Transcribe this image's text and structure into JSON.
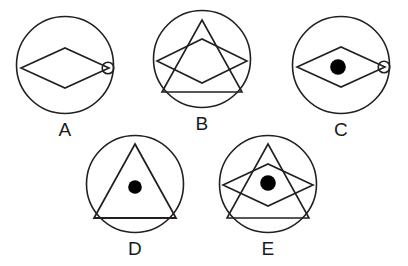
{
  "figure": {
    "background_color": "#ffffff",
    "stroke_color": "#231f20",
    "fill_color": "#000000",
    "layout": {
      "rows": 2,
      "row1_count": 3,
      "row2_count": 2,
      "circle_diameter_px": 102
    }
  },
  "options": [
    {
      "id": "A",
      "label": "A",
      "position": {
        "x": 14,
        "y": 14
      },
      "circle": {
        "cx": 51,
        "cy": 51,
        "r": 49
      },
      "elements": [
        "outer-circle",
        "rhombus",
        "small-circle-at-right-vertex"
      ],
      "rhombus": {
        "cx": 51,
        "cy": 54,
        "half_width": 44,
        "half_height": 20
      },
      "small_circle": {
        "cx": 94,
        "cy": 54,
        "r": 6,
        "filled": false
      },
      "center_dot": null,
      "triangle": null
    },
    {
      "id": "B",
      "label": "B",
      "position": {
        "x": 151,
        "y": 8
      },
      "circle": {
        "cx": 51,
        "cy": 51,
        "r": 49
      },
      "elements": [
        "outer-circle",
        "triangle",
        "rhombus"
      ],
      "rhombus": {
        "cx": 51,
        "cy": 53,
        "half_width": 45,
        "half_height": 22
      },
      "small_circle": null,
      "center_dot": null,
      "triangle": {
        "apex_x": 51,
        "apex_y": 12,
        "base_y": 84,
        "half_base": 40
      }
    },
    {
      "id": "C",
      "label": "C",
      "position": {
        "x": 290,
        "y": 14
      },
      "circle": {
        "cx": 51,
        "cy": 51,
        "r": 49
      },
      "elements": [
        "outer-circle",
        "rhombus",
        "center-dot",
        "small-circle-at-right-vertex"
      ],
      "rhombus": {
        "cx": 51,
        "cy": 53,
        "half_width": 44,
        "half_height": 20
      },
      "small_circle": {
        "cx": 94,
        "cy": 53,
        "r": 6,
        "filled": false
      },
      "center_dot": {
        "cx": 48,
        "cy": 53,
        "r": 8
      },
      "triangle": null
    },
    {
      "id": "D",
      "label": "D",
      "position": {
        "x": 84,
        "y": 133
      },
      "circle": {
        "cx": 51,
        "cy": 51,
        "r": 49
      },
      "elements": [
        "outer-circle",
        "triangle",
        "center-dot"
      ],
      "rhombus": null,
      "small_circle": null,
      "center_dot": {
        "cx": 51,
        "cy": 54,
        "r": 7
      },
      "triangle": {
        "apex_x": 51,
        "apex_y": 11,
        "base_y": 85,
        "half_base": 41
      }
    },
    {
      "id": "E",
      "label": "E",
      "position": {
        "x": 217,
        "y": 133
      },
      "circle": {
        "cx": 51,
        "cy": 51,
        "r": 49
      },
      "elements": [
        "outer-circle",
        "triangle",
        "rhombus",
        "center-dot"
      ],
      "rhombus": {
        "cx": 51,
        "cy": 52,
        "half_width": 45,
        "half_height": 21
      },
      "small_circle": null,
      "center_dot": {
        "cx": 51,
        "cy": 50,
        "r": 8
      },
      "triangle": {
        "apex_x": 51,
        "apex_y": 11,
        "base_y": 85,
        "half_base": 41
      }
    }
  ],
  "labels": {
    "a": "A",
    "b": "B",
    "c": "C",
    "d": "D",
    "e": "E"
  }
}
